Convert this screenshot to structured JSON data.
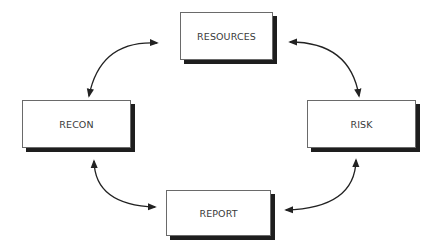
{
  "diagram": {
    "type": "cycle",
    "nodes": {
      "resources": {
        "label": "RESOURCES"
      },
      "risk": {
        "label": "RISK"
      },
      "report": {
        "label": "REPORT"
      },
      "recon": {
        "label": "RECON"
      }
    },
    "edges": [
      {
        "from": "RECON",
        "to": "RESOURCES",
        "bidirectional": true
      },
      {
        "from": "RESOURCES",
        "to": "RISK",
        "bidirectional": true
      },
      {
        "from": "RISK",
        "to": "REPORT",
        "bidirectional": true
      },
      {
        "from": "REPORT",
        "to": "RECON",
        "bidirectional": true
      }
    ],
    "colors": {
      "box_border": "#6a6a6a",
      "box_shadow": "#1e1e1e",
      "arrow": "#222222",
      "text": "#3a3a3a"
    }
  }
}
